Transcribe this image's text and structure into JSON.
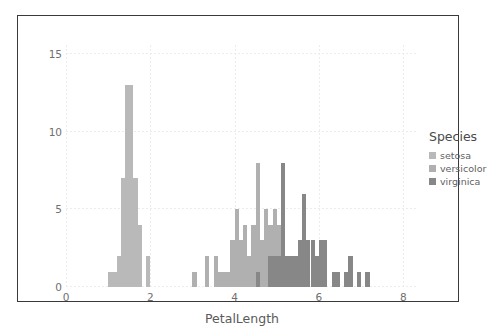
{
  "chart_data": {
    "type": "bar",
    "title": "",
    "subtitle": "",
    "xlabel": "PetalLength",
    "ylabel": "",
    "xlim": [
      0,
      8.35
    ],
    "ylim": [
      0,
      15.6
    ],
    "xticks": [
      0,
      2,
      4,
      6,
      8
    ],
    "xtick_labels": [
      "0",
      "2",
      "4",
      "6",
      "8"
    ],
    "yticks": [
      0,
      5,
      10,
      15
    ],
    "ytick_labels": [
      "0",
      "5",
      "10",
      "15"
    ],
    "grid": true,
    "legend_position": "right",
    "bin_width": 0.1,
    "stacking": "overlay",
    "series": [
      {
        "name": "setosa",
        "color": "#b9b9b9",
        "bins": [
          {
            "x": 1.0,
            "count": 1
          },
          {
            "x": 1.1,
            "count": 1
          },
          {
            "x": 1.2,
            "count": 2
          },
          {
            "x": 1.3,
            "count": 7
          },
          {
            "x": 1.4,
            "count": 13
          },
          {
            "x": 1.5,
            "count": 13
          },
          {
            "x": 1.6,
            "count": 7
          },
          {
            "x": 1.7,
            "count": 4
          },
          {
            "x": 1.9,
            "count": 2
          }
        ]
      },
      {
        "name": "versicolor",
        "color": "#b0b0b0",
        "bins": [
          {
            "x": 3.0,
            "count": 1
          },
          {
            "x": 3.3,
            "count": 2
          },
          {
            "x": 3.5,
            "count": 2
          },
          {
            "x": 3.6,
            "count": 1
          },
          {
            "x": 3.7,
            "count": 1
          },
          {
            "x": 3.8,
            "count": 1
          },
          {
            "x": 3.9,
            "count": 3
          },
          {
            "x": 4.0,
            "count": 5
          },
          {
            "x": 4.1,
            "count": 3
          },
          {
            "x": 4.2,
            "count": 4
          },
          {
            "x": 4.3,
            "count": 2
          },
          {
            "x": 4.4,
            "count": 4
          },
          {
            "x": 4.5,
            "count": 8
          },
          {
            "x": 4.6,
            "count": 3
          },
          {
            "x": 4.7,
            "count": 5
          },
          {
            "x": 4.8,
            "count": 4
          },
          {
            "x": 4.9,
            "count": 5
          },
          {
            "x": 5.0,
            "count": 4
          },
          {
            "x": 5.1,
            "count": 3
          },
          {
            "x": 5.6,
            "count": 1
          }
        ]
      },
      {
        "name": "virginica",
        "color": "#878787",
        "bins": [
          {
            "x": 4.5,
            "count": 1
          },
          {
            "x": 4.8,
            "count": 2
          },
          {
            "x": 4.9,
            "count": 2
          },
          {
            "x": 5.0,
            "count": 2
          },
          {
            "x": 5.1,
            "count": 8
          },
          {
            "x": 5.2,
            "count": 2
          },
          {
            "x": 5.3,
            "count": 2
          },
          {
            "x": 5.4,
            "count": 2
          },
          {
            "x": 5.5,
            "count": 3
          },
          {
            "x": 5.6,
            "count": 6
          },
          {
            "x": 5.7,
            "count": 3
          },
          {
            "x": 5.8,
            "count": 3
          },
          {
            "x": 5.9,
            "count": 2
          },
          {
            "x": 6.0,
            "count": 3
          },
          {
            "x": 6.1,
            "count": 3
          },
          {
            "x": 6.3,
            "count": 1
          },
          {
            "x": 6.4,
            "count": 1
          },
          {
            "x": 6.6,
            "count": 1
          },
          {
            "x": 6.7,
            "count": 2
          },
          {
            "x": 6.9,
            "count": 1
          },
          {
            "x": 7.1,
            "count": 1
          }
        ]
      }
    ]
  },
  "legend": {
    "title": "Species",
    "items": [
      {
        "label": "setosa",
        "color": "#b9b9b9"
      },
      {
        "label": "versicolor",
        "color": "#b0b0b0"
      },
      {
        "label": "virginica",
        "color": "#878787"
      }
    ]
  },
  "axis": {
    "x_label": "PetalLength"
  }
}
